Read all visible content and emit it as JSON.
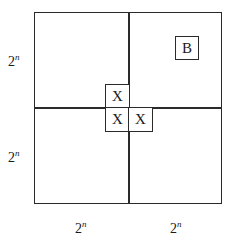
{
  "diagram": {
    "quadrant_size_label": {
      "base": "2",
      "exponent": "n"
    },
    "left_labels": [
      {
        "base": "2",
        "exponent": "n"
      },
      {
        "base": "2",
        "exponent": "n"
      }
    ],
    "bottom_labels": [
      {
        "base": "2",
        "exponent": "n"
      },
      {
        "base": "2",
        "exponent": "n"
      }
    ],
    "cells": [
      {
        "id": "b-cell",
        "label": "B",
        "quadrant": "top-right"
      },
      {
        "id": "x-cell-top-left",
        "label": "X",
        "quadrant": "top-left"
      },
      {
        "id": "x-cell-bottom-left",
        "label": "X",
        "quadrant": "bottom-left"
      },
      {
        "id": "x-cell-bottom-right",
        "label": "X",
        "quadrant": "bottom-right"
      }
    ]
  }
}
